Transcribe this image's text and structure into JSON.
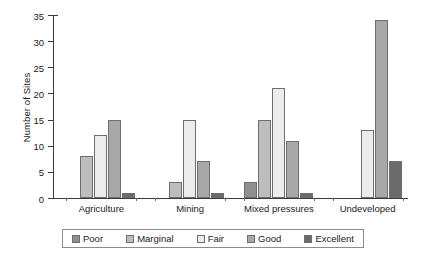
{
  "chart_data": {
    "type": "bar",
    "title": "",
    "xlabel": "",
    "ylabel": "Number of Sites",
    "ylim": [
      0,
      35
    ],
    "ytick_step": 5,
    "yticks": [
      0,
      5,
      10,
      15,
      20,
      25,
      30,
      35
    ],
    "grid": false,
    "legend_position": "bottom",
    "categories": [
      "Agriculture",
      "Mining",
      "Mixed pressures",
      "Undeveloped"
    ],
    "series": [
      {
        "name": "Poor",
        "color": "#8f8f8f",
        "values": [
          null,
          null,
          3,
          null
        ]
      },
      {
        "name": "Marginal",
        "color": "#bdbdbd",
        "values": [
          8,
          3,
          15,
          null
        ]
      },
      {
        "name": "Fair",
        "color": "#ececec",
        "values": [
          12,
          15,
          21,
          13
        ]
      },
      {
        "name": "Good",
        "color": "#a8a8a8",
        "values": [
          15,
          7,
          11,
          34
        ]
      },
      {
        "name": "Excellent",
        "color": "#6b6b6b",
        "values": [
          1,
          1,
          1,
          7
        ]
      }
    ]
  },
  "legend": {
    "items": [
      {
        "label": "Poor"
      },
      {
        "label": "Marginal"
      },
      {
        "label": "Fair"
      },
      {
        "label": "Good"
      },
      {
        "label": "Excellent"
      }
    ]
  }
}
